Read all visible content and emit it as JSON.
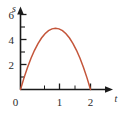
{
  "chart_data": {
    "type": "line",
    "title": "",
    "xlabel": "t",
    "ylabel": "s",
    "xlim": [
      0,
      2.4
    ],
    "ylim": [
      0,
      7.2
    ],
    "grid": false,
    "legend": null,
    "x_ticks": [
      "0",
      "1",
      "2"
    ],
    "x_tick_values": [
      0,
      1,
      2
    ],
    "y_ticks": [
      "2",
      "4",
      "6"
    ],
    "y_tick_values": [
      2,
      4,
      6
    ],
    "x_minor_ticks": [
      0.5,
      1.5
    ],
    "y_minor_ticks": [
      1,
      3,
      5,
      7
    ],
    "series": [
      {
        "name": "s(t)",
        "color": "#c4553a",
        "x": [
          0.0,
          0.1,
          0.2,
          0.3,
          0.4,
          0.5,
          0.6,
          0.7,
          0.8,
          0.9,
          1.0,
          1.1,
          1.2,
          1.3,
          1.4,
          1.5,
          1.6,
          1.7,
          1.8,
          1.9,
          2.0
        ],
        "values": [
          0.0,
          0.95,
          1.8,
          2.55,
          3.2,
          3.75,
          4.2,
          4.55,
          4.8,
          4.95,
          5.0,
          4.95,
          4.8,
          4.55,
          4.2,
          3.75,
          3.2,
          2.55,
          1.8,
          0.95,
          0.0
        ]
      }
    ],
    "annotations": {
      "peak_value": "5",
      "peak_at": "1",
      "roots": [
        "0",
        "2"
      ]
    }
  },
  "axes": {
    "y_axis_label": "s",
    "x_axis_label": "t",
    "origin_label": "0",
    "axis_color": "#1a1a1a",
    "curve_color": "#c4553a"
  },
  "labels": {
    "y2": "2",
    "y4": "4",
    "y6": "6",
    "x0": "0",
    "x1": "1",
    "x2": "2"
  }
}
